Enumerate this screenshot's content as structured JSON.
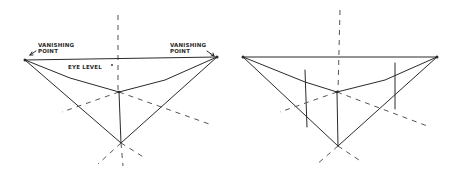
{
  "figure": {
    "panels": [
      {
        "id": "left",
        "labels": {
          "vp_left_line1": "VANISHING",
          "vp_left_line2": "POINT",
          "vp_right_line1": "VANISHING",
          "vp_right_line2": "POINT",
          "eye_level": "EYE LEVEL"
        }
      },
      {
        "id": "right",
        "labels": {}
      }
    ]
  },
  "colors": {
    "ink": "#2a2a2a",
    "background": "#ffffff"
  }
}
